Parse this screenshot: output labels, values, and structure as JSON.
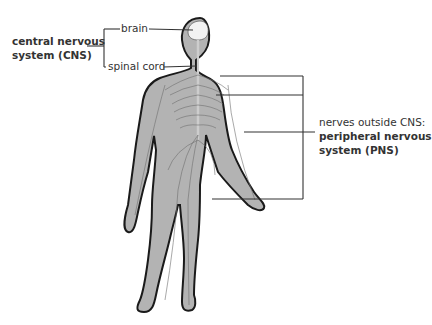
{
  "diagram": {
    "colors": {
      "body_fill": "#b3b3b3",
      "outline": "#1a1a1a",
      "nerve_lines": "#6e6e6e",
      "leader_lines": "#333333",
      "text": "#333333",
      "brain": "#f2f2f2"
    },
    "labels": {
      "cns": {
        "line1": "central nervous",
        "line2": "system (CNS)"
      },
      "brain": "brain",
      "spinal_cord": "spinal cord",
      "pns": {
        "caption": "nerves outside CNS:",
        "line1": "peripheral nervous",
        "line2": "system (PNS)"
      }
    }
  }
}
